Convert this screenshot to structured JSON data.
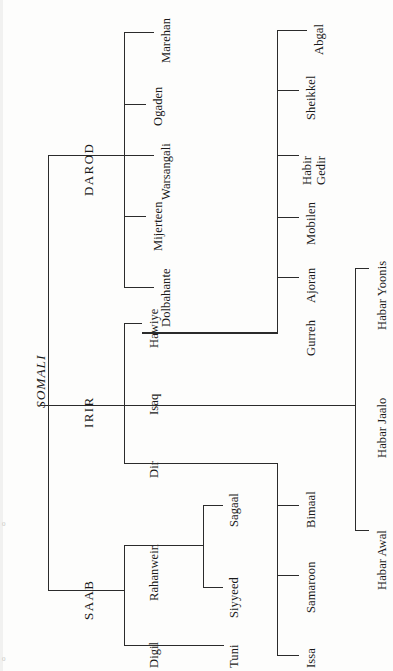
{
  "diagram": {
    "title": "SOMALI",
    "type": "genealogical clan tree",
    "orientation": "rotated 90 degrees counter-clockwise (labels read bottom-to-top)",
    "line_color": "#2b2b2b",
    "background": "#fdfdfc"
  },
  "nodes": {
    "root": {
      "label": "SOMALI"
    },
    "level1": [
      {
        "label": "DAROD"
      },
      {
        "label": "IRIR"
      },
      {
        "label": "SAAB"
      }
    ],
    "darod_children": [
      {
        "label": "Marehan"
      },
      {
        "label": "Ogaden"
      },
      {
        "label": "Warsangali"
      },
      {
        "label": "Mijerteen"
      },
      {
        "label": "Dolbahante"
      }
    ],
    "irir_children": [
      {
        "label": "Hawiye"
      },
      {
        "label": "Isaq"
      },
      {
        "label": "Dir"
      }
    ],
    "saab_children": [
      {
        "label": "Rahanwein"
      },
      {
        "label": "Digil"
      }
    ],
    "hawiye_children": [
      {
        "label": "Abgal"
      },
      {
        "label": "Sheikkel"
      },
      {
        "label": "Habir Gedir",
        "line1": "Habir",
        "line2": "Gedir"
      },
      {
        "label": "Mobilen"
      },
      {
        "label": "Ajoran"
      },
      {
        "label": "Gurreh"
      }
    ],
    "isaq_children": [
      {
        "label": "Habar Yoonis"
      },
      {
        "label": "Habar Jaalo"
      },
      {
        "label": "Habar Awal"
      }
    ],
    "dir_children": [
      {
        "label": "Bimaal"
      },
      {
        "label": "Samaroon"
      },
      {
        "label": "Issa"
      }
    ],
    "rahanwein_children": [
      {
        "label": "Sagaal"
      },
      {
        "label": "Siyyeed"
      }
    ],
    "digil_children": [
      {
        "label": "Tuni"
      }
    ]
  },
  "page_marks": {
    "mark_top": "0",
    "mark_bottom": "0"
  }
}
